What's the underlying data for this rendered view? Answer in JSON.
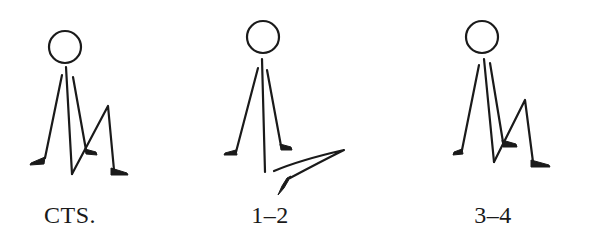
{
  "figures": [
    {
      "id": "cts",
      "label": "CTS.",
      "description": "seated stick figure, right knee bent upward"
    },
    {
      "id": "1-2",
      "label": "1–2",
      "description": "seated stick figure, leg extended horizontally"
    },
    {
      "id": "3-4",
      "label": "3–4",
      "description": "seated stick figure, right knee bent upward"
    }
  ],
  "style": {
    "ink_color": "#1a1a1a",
    "background": "#ffffff"
  }
}
